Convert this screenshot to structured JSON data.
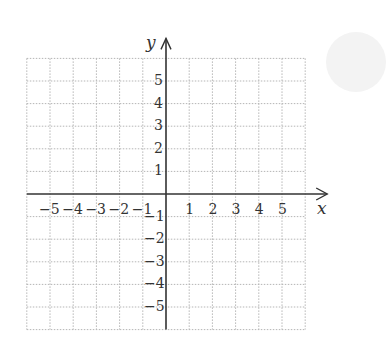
{
  "chart_data": {
    "type": "scatter",
    "title": "",
    "xlabel": "x",
    "ylabel": "y",
    "xlim": [
      -6,
      6
    ],
    "ylim": [
      -6,
      6
    ],
    "grid": true,
    "grid_style": "dotted",
    "x_ticks": [
      -5,
      -4,
      -3,
      -2,
      -1,
      1,
      2,
      3,
      4,
      5
    ],
    "y_ticks": [
      -5,
      -4,
      -3,
      -2,
      -1,
      1,
      2,
      3,
      4,
      5
    ],
    "x_tick_labels": [
      "−5",
      "−4",
      "−3",
      "−2",
      "−1",
      "1",
      "2",
      "3",
      "4",
      "5"
    ],
    "y_tick_labels": [
      "−5",
      "−4",
      "−3",
      "−2",
      "−1",
      "1",
      "2",
      "3",
      "4",
      "5"
    ],
    "series": [],
    "legend": null
  },
  "axes": {
    "x_label": "x",
    "y_label": "y"
  },
  "colors": {
    "axis": "#333333",
    "grid": "#b5b5b5",
    "text": "#333333"
  }
}
